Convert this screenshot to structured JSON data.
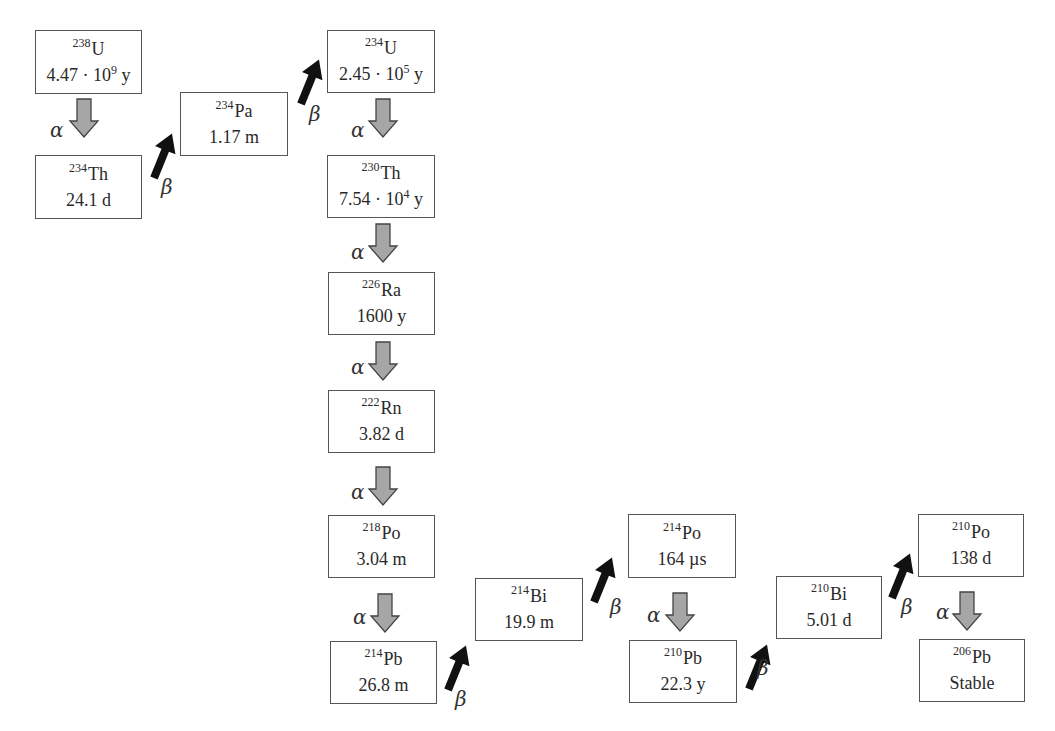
{
  "diagram": {
    "colors": {
      "box_border": "#555555",
      "alpha_arrow_fill": "#a6a6a6",
      "alpha_arrow_stroke": "#444444",
      "beta_arrow": "#111111",
      "text": "#2a2a2a"
    },
    "nuclides": [
      {
        "id": "u238",
        "mass": "238",
        "symbol": "U",
        "halflife": "4.47 · 10",
        "exp": "9",
        "unit": " y"
      },
      {
        "id": "th234",
        "mass": "234",
        "symbol": "Th",
        "halflife": "24.1 d"
      },
      {
        "id": "pa234",
        "mass": "234",
        "symbol": "Pa",
        "halflife": "1.17 m"
      },
      {
        "id": "u234",
        "mass": "234",
        "symbol": "U",
        "halflife": "2.45 · 10",
        "exp": "5",
        "unit": " y"
      },
      {
        "id": "th230",
        "mass": "230",
        "symbol": "Th",
        "halflife": "7.54 · 10",
        "exp": "4",
        "unit": " y"
      },
      {
        "id": "ra226",
        "mass": "226",
        "symbol": "Ra",
        "halflife": "1600 y"
      },
      {
        "id": "rn222",
        "mass": "222",
        "symbol": "Rn",
        "halflife": "3.82 d"
      },
      {
        "id": "po218",
        "mass": "218",
        "symbol": "Po",
        "halflife": "3.04 m"
      },
      {
        "id": "pb214",
        "mass": "214",
        "symbol": "Pb",
        "halflife": "26.8 m"
      },
      {
        "id": "bi214",
        "mass": "214",
        "symbol": "Bi",
        "halflife": "19.9 m"
      },
      {
        "id": "po214",
        "mass": "214",
        "symbol": "Po",
        "halflife": "164 µs"
      },
      {
        "id": "pb210",
        "mass": "210",
        "symbol": "Pb",
        "halflife": "22.3 y"
      },
      {
        "id": "bi210",
        "mass": "210",
        "symbol": "Bi",
        "halflife": "5.01 d"
      },
      {
        "id": "po210",
        "mass": "210",
        "symbol": "Po",
        "halflife": "138 d"
      },
      {
        "id": "pb206",
        "mass": "206",
        "symbol": "Pb",
        "halflife": "Stable"
      }
    ],
    "decays": [
      {
        "from": "U-238",
        "to": "Th-234",
        "type": "alpha",
        "label": "α"
      },
      {
        "from": "Th-234",
        "to": "Pa-234",
        "type": "beta",
        "label": "β"
      },
      {
        "from": "Pa-234",
        "to": "U-234",
        "type": "beta",
        "label": "β"
      },
      {
        "from": "U-234",
        "to": "Th-230",
        "type": "alpha",
        "label": "α"
      },
      {
        "from": "Th-230",
        "to": "Ra-226",
        "type": "alpha",
        "label": "α"
      },
      {
        "from": "Ra-226",
        "to": "Rn-222",
        "type": "alpha",
        "label": "α"
      },
      {
        "from": "Rn-222",
        "to": "Po-218",
        "type": "alpha",
        "label": "α"
      },
      {
        "from": "Po-218",
        "to": "Pb-214",
        "type": "alpha",
        "label": "α"
      },
      {
        "from": "Pb-214",
        "to": "Bi-214",
        "type": "beta",
        "label": "β"
      },
      {
        "from": "Bi-214",
        "to": "Po-214",
        "type": "beta",
        "label": "β"
      },
      {
        "from": "Po-214",
        "to": "Pb-210",
        "type": "alpha",
        "label": "α"
      },
      {
        "from": "Pb-210",
        "to": "Bi-210",
        "type": "beta",
        "label": "β"
      },
      {
        "from": "Bi-210",
        "to": "Po-210",
        "type": "beta",
        "label": "β"
      },
      {
        "from": "Po-210",
        "to": "Pb-206",
        "type": "alpha",
        "label": "α"
      }
    ],
    "labels": {
      "alpha": "α",
      "beta": "β"
    }
  }
}
